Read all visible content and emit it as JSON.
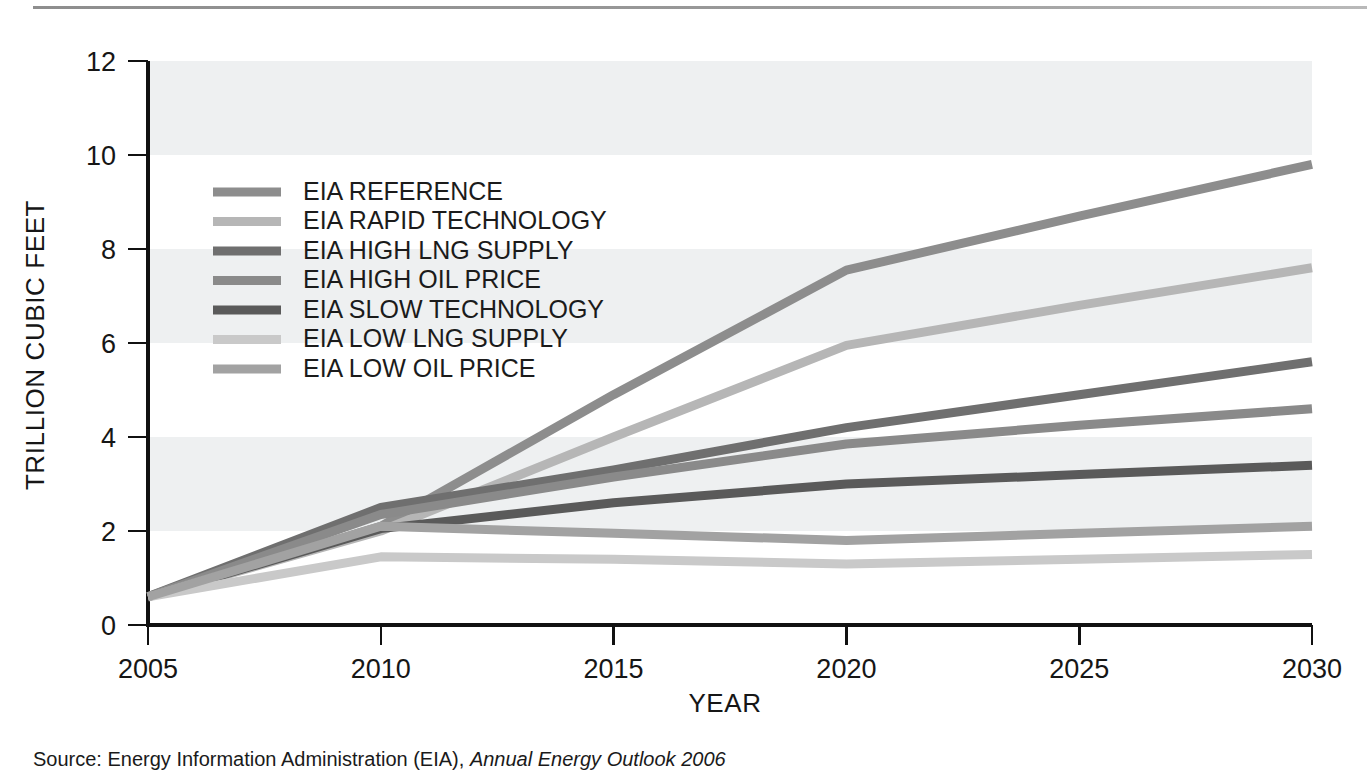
{
  "figure": {
    "source_prefix": "Source:",
    "source_body": "Energy Information Administration (EIA),",
    "source_italic": "Annual Energy Outlook 2006"
  },
  "chart_data": {
    "type": "line",
    "title": "",
    "xlabel": "YEAR",
    "ylabel": "TRILLION CUBIC FEET",
    "x": [
      2005,
      2010,
      2015,
      2020,
      2025,
      2030
    ],
    "xtick_labels": [
      "2005",
      "2010",
      "2015",
      "2020",
      "2025",
      "2030"
    ],
    "ytick_labels": [
      "0",
      "2",
      "4",
      "6",
      "8",
      "10",
      "12"
    ],
    "yticks": [
      0,
      2,
      4,
      6,
      8,
      10,
      12
    ],
    "xlim": [
      2005,
      2030
    ],
    "ylim": [
      0,
      12
    ],
    "grid": false,
    "banding": "alternating horizontal bands at 2-4, 6-8, 10-12",
    "legend_position": "upper-left inside axes",
    "series": [
      {
        "name": "EIA REFERENCE",
        "color": "#8d8d8d",
        "values": [
          0.6,
          2.1,
          4.9,
          7.55,
          8.7,
          9.8
        ]
      },
      {
        "name": "EIA RAPID TECHNOLOGY",
        "color": "#b6b6b6",
        "values": [
          0.6,
          2.0,
          4.0,
          5.95,
          6.8,
          7.6
        ]
      },
      {
        "name": "EIA HIGH LNG SUPPLY",
        "color": "#6f6f6f",
        "values": [
          0.6,
          2.5,
          3.3,
          4.2,
          4.9,
          5.6
        ]
      },
      {
        "name": "EIA HIGH OIL PRICE",
        "color": "#8a8a8a",
        "values": [
          0.6,
          2.35,
          3.15,
          3.85,
          4.25,
          4.6
        ]
      },
      {
        "name": "EIA SLOW TECHNOLOGY",
        "color": "#5a5a5a",
        "values": [
          0.6,
          2.05,
          2.6,
          3.0,
          3.2,
          3.4
        ]
      },
      {
        "name": "EIA LOW LNG SUPPLY",
        "color": "#c9c9c9",
        "values": [
          0.6,
          1.45,
          1.4,
          1.3,
          1.4,
          1.5
        ]
      },
      {
        "name": "EIA LOW OIL PRICE",
        "color": "#a2a2a2",
        "values": [
          0.6,
          2.1,
          1.95,
          1.8,
          1.95,
          2.1
        ]
      }
    ]
  }
}
